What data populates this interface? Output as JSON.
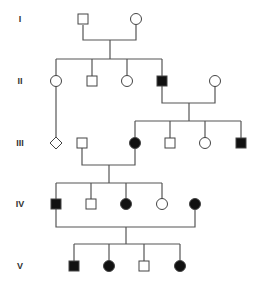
{
  "diagram": {
    "type": "pedigree",
    "colors": {
      "line": "#555555",
      "affected": "#111111",
      "unaffected": "#ffffff",
      "stroke": "#444444"
    },
    "generations": [
      {
        "label": "I",
        "y": 19
      },
      {
        "label": "II",
        "y": 81
      },
      {
        "label": "III",
        "y": 143
      },
      {
        "label": "IV",
        "y": 204
      },
      {
        "label": "V",
        "y": 266
      }
    ],
    "individuals": [
      {
        "id": "I-1",
        "sex": "male",
        "affected": false,
        "x": 83,
        "y": 19
      },
      {
        "id": "I-2",
        "sex": "female",
        "affected": false,
        "x": 136,
        "y": 19
      },
      {
        "id": "II-1",
        "sex": "female",
        "affected": false,
        "x": 56,
        "y": 81
      },
      {
        "id": "II-2",
        "sex": "male",
        "affected": false,
        "x": 92,
        "y": 81
      },
      {
        "id": "II-3",
        "sex": "female",
        "affected": false,
        "x": 127,
        "y": 81
      },
      {
        "id": "II-4",
        "sex": "male",
        "affected": true,
        "x": 162,
        "y": 81
      },
      {
        "id": "II-5",
        "sex": "female",
        "affected": false,
        "x": 215,
        "y": 81
      },
      {
        "id": "III-1",
        "sex": "unknown",
        "affected": false,
        "x": 56,
        "y": 143
      },
      {
        "id": "III-2",
        "sex": "male",
        "affected": false,
        "x": 82,
        "y": 143
      },
      {
        "id": "III-3",
        "sex": "female",
        "affected": true,
        "x": 135,
        "y": 143
      },
      {
        "id": "III-4",
        "sex": "male",
        "affected": false,
        "x": 170,
        "y": 143
      },
      {
        "id": "III-5",
        "sex": "female",
        "affected": false,
        "x": 205,
        "y": 143
      },
      {
        "id": "III-6",
        "sex": "male",
        "affected": true,
        "x": 241,
        "y": 143
      },
      {
        "id": "IV-1",
        "sex": "male",
        "affected": true,
        "x": 56,
        "y": 204
      },
      {
        "id": "IV-2",
        "sex": "male",
        "affected": false,
        "x": 91,
        "y": 204
      },
      {
        "id": "IV-3",
        "sex": "female",
        "affected": true,
        "x": 126,
        "y": 204
      },
      {
        "id": "IV-4",
        "sex": "female",
        "affected": false,
        "x": 162,
        "y": 204
      },
      {
        "id": "IV-5",
        "sex": "female",
        "affected": true,
        "x": 195,
        "y": 204
      },
      {
        "id": "V-1",
        "sex": "male",
        "affected": true,
        "x": 74,
        "y": 266
      },
      {
        "id": "V-2",
        "sex": "female",
        "affected": true,
        "x": 109,
        "y": 266
      },
      {
        "id": "V-3",
        "sex": "male",
        "affected": false,
        "x": 144,
        "y": 266
      },
      {
        "id": "V-4",
        "sex": "female",
        "affected": true,
        "x": 180,
        "y": 266
      }
    ],
    "lines": [
      {
        "name": "mating-I1-I2",
        "points": [
          [
            83,
            25
          ],
          [
            83,
            40
          ],
          [
            136,
            40
          ],
          [
            136,
            25
          ]
        ]
      },
      {
        "name": "descent-I",
        "points": [
          [
            110,
            40
          ],
          [
            110,
            59
          ]
        ]
      },
      {
        "name": "sibship-II",
        "points": [
          [
            56,
            59
          ],
          [
            162,
            59
          ]
        ]
      },
      {
        "name": "drop-II-1",
        "points": [
          [
            56,
            59
          ],
          [
            56,
            76
          ]
        ]
      },
      {
        "name": "drop-II-2",
        "points": [
          [
            92,
            59
          ],
          [
            92,
            76
          ]
        ]
      },
      {
        "name": "drop-II-3",
        "points": [
          [
            127,
            59
          ],
          [
            127,
            76
          ]
        ]
      },
      {
        "name": "drop-II-4",
        "points": [
          [
            162,
            59
          ],
          [
            162,
            76
          ]
        ]
      },
      {
        "name": "line-II-1-to-III-1",
        "points": [
          [
            56,
            86
          ],
          [
            56,
            137
          ]
        ]
      },
      {
        "name": "mating-II4-II5",
        "points": [
          [
            162,
            86
          ],
          [
            162,
            103
          ],
          [
            215,
            103
          ],
          [
            215,
            86
          ]
        ]
      },
      {
        "name": "descent-II",
        "points": [
          [
            189,
            103
          ],
          [
            189,
            121
          ]
        ]
      },
      {
        "name": "sibship-III",
        "points": [
          [
            135,
            121
          ],
          [
            241,
            121
          ]
        ]
      },
      {
        "name": "drop-III-3",
        "points": [
          [
            135,
            121
          ],
          [
            135,
            138
          ]
        ]
      },
      {
        "name": "drop-III-4",
        "points": [
          [
            170,
            121
          ],
          [
            170,
            138
          ]
        ]
      },
      {
        "name": "drop-III-5",
        "points": [
          [
            205,
            121
          ],
          [
            205,
            138
          ]
        ]
      },
      {
        "name": "drop-III-6",
        "points": [
          [
            241,
            121
          ],
          [
            241,
            138
          ]
        ]
      },
      {
        "name": "mating-III2-III3",
        "points": [
          [
            82,
            148
          ],
          [
            82,
            165
          ],
          [
            135,
            165
          ],
          [
            135,
            148
          ]
        ]
      },
      {
        "name": "descent-III",
        "points": [
          [
            109,
            165
          ],
          [
            109,
            183
          ]
        ]
      },
      {
        "name": "sibship-IV",
        "points": [
          [
            56,
            183
          ],
          [
            162,
            183
          ]
        ]
      },
      {
        "name": "drop-IV-1",
        "points": [
          [
            56,
            183
          ],
          [
            56,
            199
          ]
        ]
      },
      {
        "name": "drop-IV-2",
        "points": [
          [
            91,
            183
          ],
          [
            91,
            199
          ]
        ]
      },
      {
        "name": "drop-IV-3",
        "points": [
          [
            126,
            183
          ],
          [
            126,
            199
          ]
        ]
      },
      {
        "name": "drop-IV-4",
        "points": [
          [
            162,
            183
          ],
          [
            162,
            199
          ]
        ]
      },
      {
        "name": "mating-IV1-IV5",
        "points": [
          [
            56,
            209
          ],
          [
            56,
            227
          ],
          [
            195,
            227
          ],
          [
            195,
            209
          ]
        ]
      },
      {
        "name": "descent-IV",
        "points": [
          [
            126,
            227
          ],
          [
            126,
            244
          ]
        ]
      },
      {
        "name": "sibship-V",
        "points": [
          [
            74,
            244
          ],
          [
            180,
            244
          ]
        ]
      },
      {
        "name": "drop-V-1",
        "points": [
          [
            74,
            244
          ],
          [
            74,
            261
          ]
        ]
      },
      {
        "name": "drop-V-2",
        "points": [
          [
            109,
            244
          ],
          [
            109,
            261
          ]
        ]
      },
      {
        "name": "drop-V-3",
        "points": [
          [
            144,
            244
          ],
          [
            144,
            261
          ]
        ]
      },
      {
        "name": "drop-V-4",
        "points": [
          [
            180,
            244
          ],
          [
            180,
            261
          ]
        ]
      }
    ]
  }
}
